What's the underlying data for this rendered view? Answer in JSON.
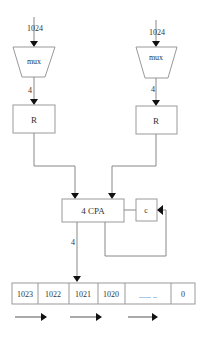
{
  "diagram": {
    "inputs": {
      "left_width_label": "1024",
      "right_width_label": "1024"
    },
    "muxes": {
      "left_label": "mux",
      "right_label": "mux"
    },
    "mux_outputs": {
      "left_width_label": "4",
      "right_width_label": "4"
    },
    "registers": {
      "left_label": "R",
      "right_label": "R"
    },
    "adder": {
      "label": "4 CPA",
      "output_width_label": "4"
    },
    "carry": {
      "label": "c"
    },
    "result_register": {
      "cells": [
        "1023",
        "1022",
        "1021",
        "1020",
        "...... ..",
        "0"
      ]
    },
    "shift_arrows": 3,
    "colors": {
      "line": "#888888",
      "box_border": "#999999",
      "arrowhead": "#111111",
      "text": "#333333",
      "background": "#ffffff"
    }
  }
}
